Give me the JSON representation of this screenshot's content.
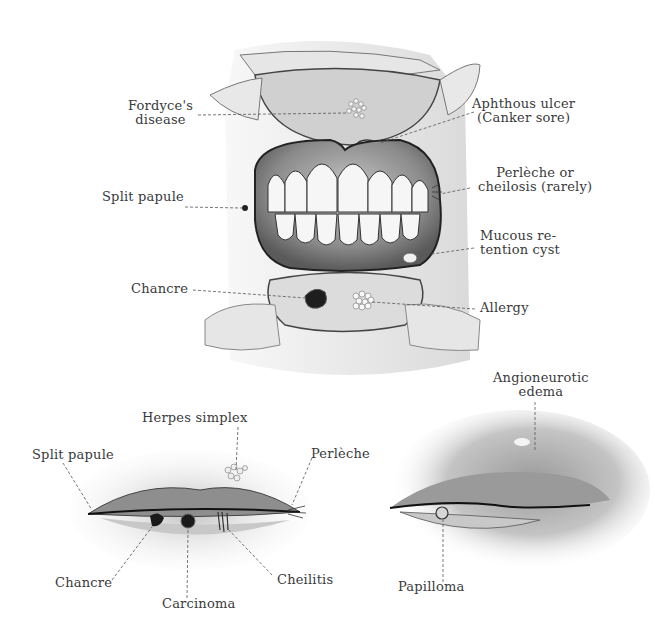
{
  "diagram": {
    "top_panel": {
      "name": "open-mouth-view",
      "labels": [
        {
          "id": "fordyce",
          "lines": [
            "Fordyce's",
            "disease"
          ]
        },
        {
          "id": "aphthous",
          "lines": [
            "Aphthous ulcer",
            "(Canker sore)"
          ]
        },
        {
          "id": "perleche-top",
          "lines": [
            "Perlèche or",
            "cheilosis (rarely)"
          ]
        },
        {
          "id": "split-papule-top",
          "lines": [
            "Split papule"
          ]
        },
        {
          "id": "mucous-cyst",
          "lines": [
            "Mucous re-",
            "tention cyst"
          ]
        },
        {
          "id": "chancre-top",
          "lines": [
            "Chancre"
          ]
        },
        {
          "id": "allergy",
          "lines": [
            "Allergy"
          ]
        }
      ]
    },
    "bottom_left_panel": {
      "name": "lips-front-view",
      "labels": [
        {
          "id": "herpes",
          "lines": [
            "Herpes simplex"
          ]
        },
        {
          "id": "split-papule-bottom",
          "lines": [
            "Split papule"
          ]
        },
        {
          "id": "perleche-bottom",
          "lines": [
            "Perlèche"
          ]
        },
        {
          "id": "chancre-bottom",
          "lines": [
            "Chancre"
          ]
        },
        {
          "id": "carcinoma",
          "lines": [
            "Carcinoma"
          ]
        },
        {
          "id": "cheilitis",
          "lines": [
            "Cheilitis"
          ]
        }
      ]
    },
    "bottom_right_panel": {
      "name": "lips-side-view",
      "labels": [
        {
          "id": "angioneurotic",
          "lines": [
            "Angioneurotic",
            "edema"
          ]
        },
        {
          "id": "papilloma",
          "lines": [
            "Papilloma"
          ]
        }
      ]
    },
    "colors": {
      "ink": "#3a3a3a",
      "leader": "#555555",
      "shade_dark": "#6e6e6e",
      "shade_mid": "#a8a8a8",
      "shade_light": "#d9d9d9",
      "lesion": "#222222",
      "background": "#ffffff"
    }
  }
}
